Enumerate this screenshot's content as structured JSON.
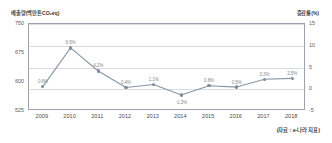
{
  "axes": {
    "left_unit": "배출량(백만톤CO₂eq)",
    "right_unit": "증감률(%)",
    "left_ticks": [
      "750",
      "675",
      "600",
      "525"
    ],
    "right_ticks": [
      "15",
      "10",
      "5",
      "0",
      "-5"
    ]
  },
  "source": {
    "note": "(자료 : e-나라 지표)"
  },
  "chart_data": {
    "type": "line",
    "title": "",
    "subtitle": "",
    "xlabel": "",
    "ylabel": "배출량(백만톤CO₂eq)",
    "y2label": "증감률(%)",
    "ylim": [
      525,
      750
    ],
    "y2lim": [
      -5,
      15
    ],
    "grid": true,
    "legend": "none",
    "categories": [
      "2009",
      "2010",
      "2011",
      "2012",
      "2013",
      "2014",
      "2015",
      "2016",
      "2017",
      "2018"
    ],
    "series": [
      {
        "name": "증감률",
        "unit": "%",
        "values": [
          0.6,
          9.5,
          4.2,
          0.4,
          1.1,
          -1.3,
          0.8,
          0.5,
          2.3,
          2.5
        ],
        "point_labels": [
          "0.6%",
          "9.5%",
          "4.2%",
          "0.4%",
          "1.1%",
          "-1.3%",
          "0.8%",
          "0.5%",
          "2.3%",
          "2.5%"
        ]
      }
    ],
    "colors": {
      "line": "#8896a4",
      "marker": "#7f8c9b",
      "grid": "#d9dde2",
      "frame": "#9aa3ad",
      "point_label": "#8a8a8a"
    }
  }
}
